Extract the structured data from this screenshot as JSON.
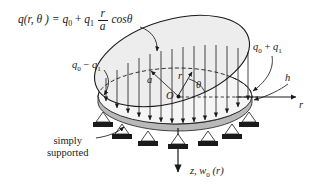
{
  "figure": {
    "kind": "engineering-diagram",
    "colors": {
      "ink": "#1a1a1a",
      "load_surface_fill": "#ececec",
      "plate_top_fill": "#f2f2f2",
      "plate_edge_fill": "#b9b9b9",
      "support_block_fill": "#1a1a1a",
      "background": "#ffffff"
    }
  },
  "labels": {
    "load_equation": {
      "lhs": "q(r, θ ) =",
      "term1": "q",
      "term1_sub": "0",
      "plus": "+",
      "term2": "q",
      "term2_sub": "1",
      "frac_num": "r",
      "frac_den": "a",
      "trig": "cosθ"
    },
    "edge_min": {
      "base1": "q",
      "sub1": "0",
      "op": "−",
      "base2": "q",
      "sub2": "1"
    },
    "edge_max": {
      "base1": "q",
      "sub1": "0",
      "op": "+",
      "base2": "q",
      "sub2": "1"
    },
    "thickness": "h",
    "radial_axis": "r",
    "plate_radius": "a",
    "radial_coordinate": "r",
    "angle_coordinate": "θ",
    "origin": "O",
    "boundary_condition_line1": "simply",
    "boundary_condition_line2": "supported",
    "deflection_axis": {
      "axis": "z,",
      "symbol": "w",
      "sub": "0",
      "arg": "(r)"
    }
  }
}
